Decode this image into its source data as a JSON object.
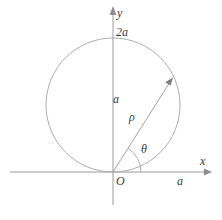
{
  "figure": {
    "kind": "polar-coordinate-circle-diagram",
    "background_color": "#ffffff",
    "line_color": "#9a9a9a",
    "text_color": "#3a3a3a",
    "axes": {
      "x_axis_label": "x",
      "y_axis_label": "y",
      "origin_label": "O",
      "x_axis": {
        "x1": 10,
        "y1": 172,
        "x2": 212,
        "y2": 172,
        "arrow": "right"
      },
      "y_axis": {
        "x1": 113,
        "y1": 205,
        "x2": 113,
        "y2": 8,
        "arrow": "up"
      }
    },
    "circle": {
      "center_x": 113,
      "center_y": 105,
      "radius": 67,
      "top_point_label": "2a",
      "vertical_diameter_label": "a",
      "tangent_point": "O"
    },
    "radius_vector": {
      "label": "ρ",
      "from_x": 113,
      "from_y": 172,
      "to_x": 172,
      "to_y": 79,
      "arrow": "end"
    },
    "angle": {
      "label": "θ",
      "arc_radius": 28,
      "from_axis": "positive-x",
      "degrees": 58
    },
    "x_axis_tick_label": "a"
  }
}
